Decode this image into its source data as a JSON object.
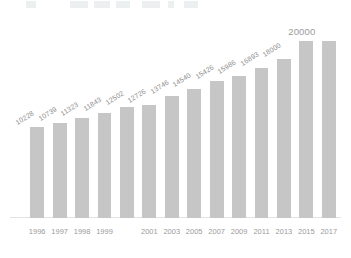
{
  "chart_data": {
    "type": "bar",
    "title": "",
    "subtitle": "",
    "xlabel": "",
    "ylabel": "",
    "categories": [
      "1996",
      "1997",
      "1998",
      "1999",
      "2001",
      "2003",
      "2005",
      "2007",
      "2009",
      "2011",
      "2013",
      "2015",
      "2017"
    ],
    "ticks": [
      "1996",
      "1997",
      "1998",
      "1999",
      "2001",
      "2003",
      "2005",
      "2007",
      "2009",
      "2011",
      "2013",
      "2015",
      "2017"
    ],
    "bars": [
      {
        "tick": "1996",
        "label": "10228",
        "value": 10228
      },
      {
        "tick": "1997",
        "label": "10739",
        "value": 10739
      },
      {
        "tick": "1998",
        "label": "11323",
        "value": 11323
      },
      {
        "tick": "1999",
        "label": "11843",
        "value": 11843
      },
      {
        "tick": "",
        "label": "12502",
        "value": 12502
      },
      {
        "tick": "2001",
        "label": "12726",
        "value": 12726
      },
      {
        "tick": "2003",
        "label": "13746",
        "value": 13746
      },
      {
        "tick": "2005",
        "label": "14540",
        "value": 14540
      },
      {
        "tick": "2007",
        "label": "15426",
        "value": 15426
      },
      {
        "tick": "2009",
        "label": "15986",
        "value": 15986
      },
      {
        "tick": "2011",
        "label": "16893",
        "value": 16893
      },
      {
        "tick": "2013",
        "label": "18000",
        "value": 18000
      },
      {
        "tick": "2015",
        "label": "20000",
        "value": 20000
      },
      {
        "tick": "2017",
        "label": "",
        "value": 20000
      }
    ],
    "values": [
      10228,
      10739,
      11323,
      11843,
      12502,
      12726,
      13746,
      14540,
      15426,
      15986,
      16893,
      18000,
      20000
    ],
    "labels": [
      "10228",
      "10739",
      "11323",
      "11843",
      "12502",
      "12726",
      "13746",
      "14540",
      "15426",
      "15986",
      "16893",
      "18000",
      "20000"
    ],
    "ylim": [
      0,
      21000
    ],
    "grid": false,
    "legend": null,
    "legend_position": "none",
    "bar_color": "#c6c6c6",
    "label_color": "#8d8d8d",
    "tick_color": "#9a9a9a",
    "background": "#ffffff"
  }
}
